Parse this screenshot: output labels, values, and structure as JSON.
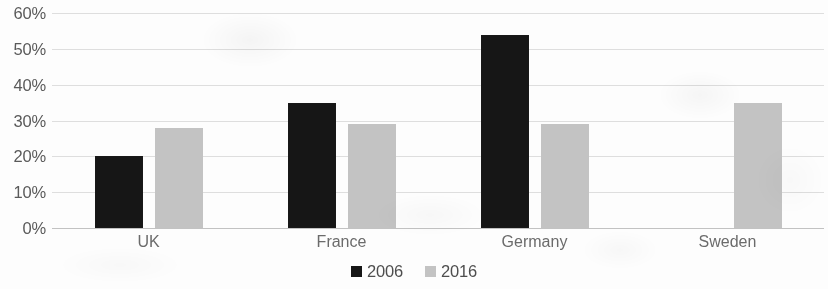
{
  "chart_data": {
    "type": "bar",
    "title": "",
    "subtitle": "",
    "xlabel": "",
    "ylabel": "",
    "categories": [
      "UK",
      "France",
      "Germany",
      "Sweden"
    ],
    "series": [
      {
        "name": "2006",
        "color": "#161616",
        "values": [
          20,
          35,
          54,
          null
        ]
      },
      {
        "name": "2016",
        "color": "#c3c3c3",
        "values": [
          28,
          29,
          29,
          35
        ]
      }
    ],
    "ylim": [
      0,
      60
    ],
    "ytick_step": 10,
    "ytick_labels": [
      "0%",
      "10%",
      "20%",
      "30%",
      "40%",
      "50%",
      "60%"
    ],
    "ytick_values": [
      0,
      10,
      20,
      30,
      40,
      50,
      60
    ],
    "value_suffix": "%",
    "grid": true,
    "grid_axis": "y",
    "legend_position": "bottom",
    "annotations": []
  },
  "legend": {
    "items": [
      {
        "label": "2006",
        "color": "#161616"
      },
      {
        "label": "2016",
        "color": "#c3c3c3"
      }
    ]
  },
  "colors": {
    "series_2006": "#161616",
    "series_2016": "#c3c3c3",
    "gridline": "#d8d8d8",
    "axis_text": "#5a5a5a",
    "background": "#fdfdfd"
  }
}
